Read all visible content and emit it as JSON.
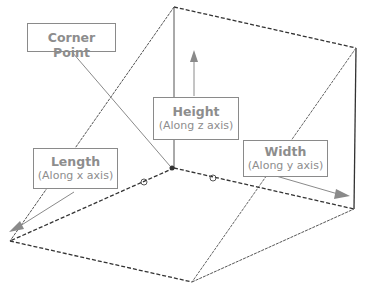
{
  "labels": {
    "corner": {
      "title": "Corner Point"
    },
    "height": {
      "title": "Height",
      "subtitle": "(Along z axis)"
    },
    "width": {
      "title": "Width",
      "subtitle": "(Along y axis)"
    },
    "length": {
      "title": "Length",
      "subtitle": "(Along x axis)"
    }
  },
  "colors": {
    "edge": "#333333",
    "leader": "#8a8a8a",
    "text": "#8d8d8d"
  }
}
